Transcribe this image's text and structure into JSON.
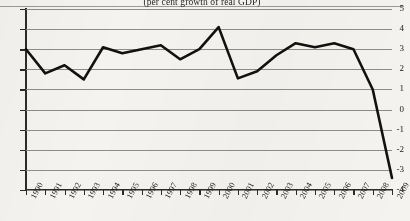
{
  "chart_data": {
    "type": "line",
    "title": "(per cent growth of real GDP)",
    "xlabel": "",
    "ylabel": "",
    "ylim": [
      -4,
      5
    ],
    "ytick_values": [
      5,
      4,
      3,
      2,
      1,
      0,
      -1,
      -2,
      -3,
      -4
    ],
    "ytick_labels": [
      "5",
      "4",
      "3",
      "2",
      "1",
      "0",
      "-1",
      "-2",
      "-3",
      "-4"
    ],
    "grid": true,
    "legend": "none",
    "categories": [
      "1990",
      "1991",
      "1992",
      "1993",
      "1994",
      "1995",
      "1996",
      "1997",
      "1998",
      "1999",
      "2000",
      "2001",
      "2002",
      "2003",
      "2004",
      "2005",
      "2006",
      "2007",
      "2008",
      "2009"
    ],
    "series": [
      {
        "name": "World real GDP growth",
        "color": "#111111",
        "values": [
          3.0,
          1.8,
          2.2,
          1.5,
          3.1,
          2.8,
          3.0,
          3.2,
          2.5,
          3.0,
          4.1,
          1.55,
          1.9,
          2.7,
          3.3,
          3.1,
          3.3,
          3.0,
          1.0,
          -3.4
        ]
      }
    ],
    "annotations": []
  }
}
